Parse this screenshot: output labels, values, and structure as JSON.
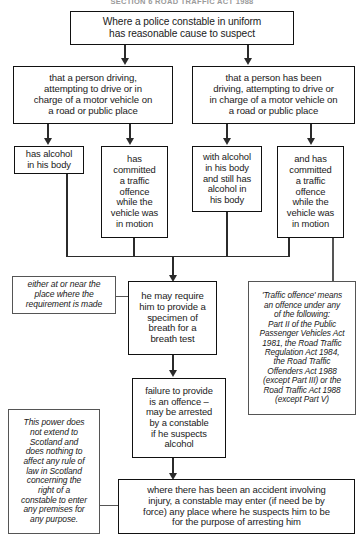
{
  "page": {
    "header_clipped": "SECTION 6 ROAD TRAFFIC ACT 1988"
  },
  "nodes": {
    "root": "Where a police constable in uniform\nhas reasonable cause to suspect",
    "branch_left": "that a person driving,\nattempting to drive or in\ncharge of a motor vehicle on\na road or public place",
    "branch_right": "that a person has been\ndriving, attempting to drive or\nin charge of a motor vehicle on\na road or public place",
    "cond_1": "has alcohol\nin his body",
    "cond_2": "has\ncommitted\na traffic\noffence\nwhile the\nvehicle was\nin motion",
    "cond_3": "with alcohol\nin his body\nand still has\nalcohol in\nhis body",
    "cond_4": "and has\ncommitted\na traffic\noffence\nwhile the\nvehicle was\nin motion",
    "note_place": "either at or near the\nplace where the\nrequirement is made",
    "require_breath": "he may require\nhim to provide a\nspecimen of\nbreath for a\nbreath test",
    "note_traffic_offence": "'Traffic offence' means\nan offence under any\nof the following:\nPart II of the Public\nPassenger Vehicles Act\n1981, the Road Traffic\nRegulation Act 1984,\nthe Road Traffic\nOffenders Act 1988\n(except Part III) or the\nRoad Traffic Act 1988\n(except Part V)",
    "failure": "failure to provide\nis an offence –\nmay be arrested\nby a constable\nif he suspects\nalcohol",
    "note_scotland": "This power does\nnot extend to\nScotland and\ndoes nothing to\naffect any rule of\nlaw in Scotland\nconcerning the\nright of a\nconstable to enter\nany premises for\nany purpose.",
    "accident": "where there has been an accident involving\ninjury, a constable may enter (if need be by\nforce) any place where he suspects him to be\nfor the purpose of arresting him"
  },
  "colors": {
    "line": "#2b2b2b",
    "note_line": "#555555",
    "text": "#1a1a1a",
    "background": "#ffffff"
  }
}
